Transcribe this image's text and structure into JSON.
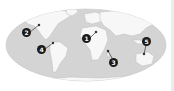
{
  "map": {
    "projection": "elliptical world map",
    "colors": {
      "sea": "#d4d4d4",
      "land": "#f7f7f7",
      "land_relief": "#bdbdbd",
      "marker": "#1a1a1a",
      "marker_text": "#ffffff",
      "background": "#ffffff"
    },
    "markers": [
      {
        "label": "1",
        "x": 86,
        "y": 38,
        "dot_x": 96,
        "dot_y": 32
      },
      {
        "label": "2",
        "x": 26,
        "y": 32,
        "dot_x": 39,
        "dot_y": 25
      },
      {
        "label": "3",
        "x": 113,
        "y": 62,
        "dot_x": 108,
        "dot_y": 51
      },
      {
        "label": "4",
        "x": 41,
        "y": 49,
        "dot_x": 53,
        "dot_y": 43
      },
      {
        "label": "5",
        "x": 146,
        "y": 41,
        "dot_x": 144,
        "dot_y": 54
      }
    ]
  }
}
